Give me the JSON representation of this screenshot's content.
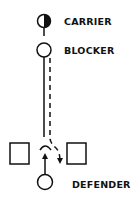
{
  "diagram": {
    "type": "play-diagram",
    "labels": {
      "carrier": "CARRIER",
      "blocker": "BLOCKER",
      "defender": "DEFENDER"
    },
    "nodes": [
      {
        "id": "carrier",
        "shape": "half-filled-circle",
        "label": "CARRIER"
      },
      {
        "id": "blocker",
        "shape": "circle",
        "label": "BLOCKER"
      },
      {
        "id": "left-obstacle",
        "shape": "square"
      },
      {
        "id": "right-obstacle",
        "shape": "square"
      },
      {
        "id": "defender",
        "shape": "circle",
        "label": "DEFENDER"
      }
    ],
    "paths": [
      {
        "from": "carrier",
        "to": "right-obstacle-gap",
        "style": "dashed",
        "arrow": true
      },
      {
        "from": "blocker",
        "to": "gap",
        "style": "solid",
        "ending": "block-cap"
      },
      {
        "from": "defender",
        "to": "gap",
        "style": "solid",
        "arrow": true
      }
    ],
    "colors": {
      "ink": "#111111",
      "background": "#ffffff"
    }
  }
}
